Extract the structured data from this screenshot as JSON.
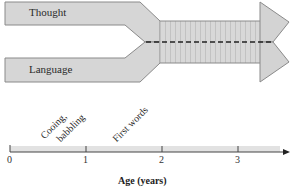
{
  "diagram": {
    "bands": [
      {
        "label": "Thought",
        "position": "top"
      },
      {
        "label": "Language",
        "position": "bottom"
      }
    ],
    "merged_segment": {
      "style": "vertical stripes with dashed center line",
      "start_age_approx": 1.95
    },
    "colors": {
      "band_fill": "#d6d6d6",
      "band_stroke": "#8a8a8a",
      "stripe": "#c4c4c4",
      "dash": "#222222",
      "axis": "#444444",
      "axis_fill": "#e2e2e2"
    }
  },
  "timeline": {
    "axis_title": "Age (years)",
    "ticks": [
      "0",
      "1",
      "2",
      "3"
    ],
    "milestones": [
      {
        "label": "Cooing,",
        "age": 0.45
      },
      {
        "label": "babbling",
        "age": 0.6
      },
      {
        "label": "First words",
        "age": 1.0
      }
    ]
  }
}
